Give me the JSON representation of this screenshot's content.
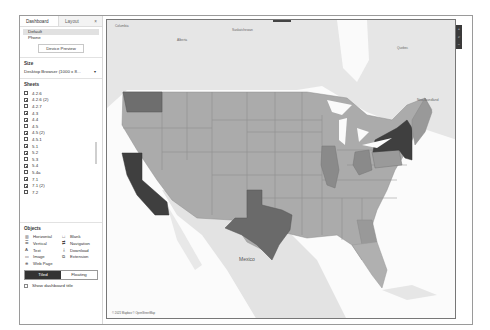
{
  "sidebar": {
    "tabs": [
      {
        "label": "Dashboard",
        "active": true
      },
      {
        "label": "Layout",
        "active": false
      }
    ],
    "tab_close": "×",
    "devices": [
      {
        "label": "Default",
        "selected": true
      },
      {
        "label": "Phone",
        "selected": false
      }
    ],
    "device_preview_label": "Device Preview",
    "size": {
      "title": "Size",
      "value": "Desktop Browser (1000 x 8...",
      "caret": "▾"
    },
    "sheets": {
      "title": "Sheets",
      "items": [
        "4.2.6",
        "4.2.6 (2)",
        "4.2.7",
        "4.3",
        "4.4",
        "4.5",
        "4.5 (2)",
        "4.5.1",
        "5.1",
        "5.2",
        "5.3",
        "5.4",
        "5.4a",
        "7.1",
        "7.1 (2)",
        "7.2"
      ]
    },
    "objects": {
      "title": "Objects",
      "items": [
        {
          "label": "Horizontal",
          "icon": "horizontal-container-icon",
          "glyph": "▥"
        },
        {
          "label": "Blank",
          "icon": "blank-icon",
          "glyph": "□"
        },
        {
          "label": "Vertical",
          "icon": "vertical-container-icon",
          "glyph": "☰"
        },
        {
          "label": "Navigation",
          "icon": "navigation-icon",
          "glyph": "⇄"
        },
        {
          "label": "Text",
          "icon": "text-icon",
          "glyph": "A"
        },
        {
          "label": "Download",
          "icon": "download-icon",
          "glyph": "⤓"
        },
        {
          "label": "Image",
          "icon": "image-icon",
          "glyph": "▭"
        },
        {
          "label": "Extension",
          "icon": "extension-icon",
          "glyph": "⧉"
        },
        {
          "label": "Web Page",
          "icon": "web-page-icon",
          "glyph": "⊕"
        }
      ]
    },
    "layout_mode": {
      "tiled": "Tiled",
      "floating": "Floating",
      "selected": "Tiled"
    },
    "show_title_label": "Show dashboard title"
  },
  "map": {
    "attribution": "© 2021 Mapbox © OpenStreetMap",
    "labels": {
      "columbia": "Columbia",
      "alberta": "Alberta",
      "saskatchewan": "Saskatchewan",
      "quebec": "Quebec",
      "newfoundland": "New-foundland",
      "mexico": "Mexico"
    },
    "toolbar": [
      {
        "name": "zoom-in-icon",
        "glyph": "+"
      },
      {
        "name": "search-icon",
        "glyph": "⌕"
      },
      {
        "name": "zoom-out-icon",
        "glyph": "−"
      }
    ],
    "colors": {
      "darkest": "#4a4a4a",
      "dark": "#6e6e6e",
      "medium": "#8c8c8c",
      "light": "#a8a8a8",
      "lightest": "#b8b8b8",
      "land": "#e3e3e3",
      "water": "#ffffff"
    }
  }
}
